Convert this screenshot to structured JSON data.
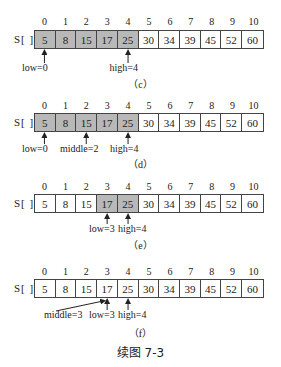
{
  "array_label": "S[ ]",
  "indices": [
    "0",
    "1",
    "2",
    "3",
    "4",
    "5",
    "6",
    "7",
    "8",
    "9",
    "10"
  ],
  "values": [
    "5",
    "8",
    "15",
    "17",
    "25",
    "30",
    "34",
    "39",
    "45",
    "52",
    "60"
  ],
  "colors": {
    "highlight": "#b8b8b8",
    "border": "#444444"
  },
  "panels": [
    {
      "caption": "（c）",
      "highlighted": [
        0,
        1,
        2,
        3,
        4
      ],
      "pointers": [
        {
          "label": "low=0",
          "index": 0
        },
        {
          "label": "high=4",
          "index": 4
        }
      ]
    },
    {
      "caption": "（d）",
      "highlighted": [
        0,
        1,
        2,
        3,
        4
      ],
      "pointers": [
        {
          "label": "low=0",
          "index": 0
        },
        {
          "label": "middle=2",
          "index": 2
        },
        {
          "label": "high=4",
          "index": 4
        }
      ]
    },
    {
      "caption": "（e）",
      "highlighted": [
        3,
        4
      ],
      "pointers": [
        {
          "label": "low=3",
          "index": 3
        },
        {
          "label": "high=4",
          "index": 4
        }
      ]
    },
    {
      "caption": "（f）",
      "highlighted": [],
      "pointers": [
        {
          "label": "middle=3",
          "index": 3
        },
        {
          "label": "low=3",
          "index": 3
        },
        {
          "label": "high=4",
          "index": 4
        }
      ]
    }
  ],
  "figure_title": "续图 7-3"
}
